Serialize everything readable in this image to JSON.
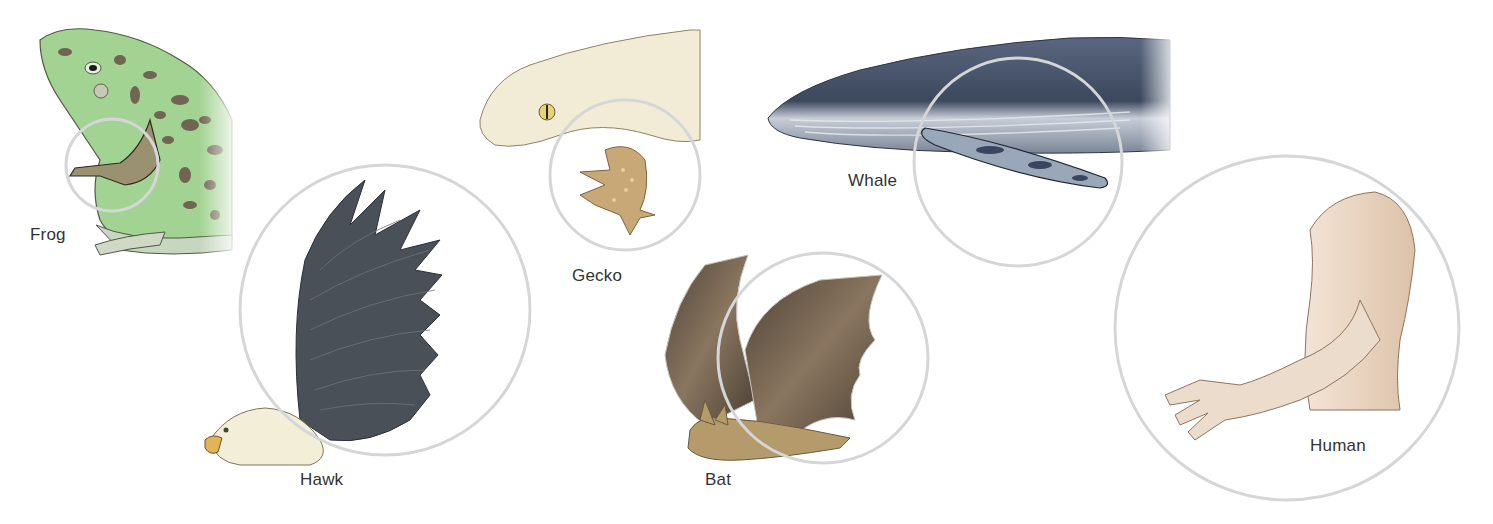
{
  "figure": {
    "colors": {
      "background": "#ffffff",
      "circle_stroke": "#d4d6d8",
      "label_text": "#333333",
      "frog_green": "#9fd08f",
      "frog_spots": "#6b5a4c",
      "hawk_wing": "#4a5058",
      "gecko_body": "#f2ecd6",
      "gecko_limb": "#c9a877",
      "whale_body": "#3f4d62",
      "bat_wing": "#5a4e3f",
      "bat_body": "#b59b6c",
      "human_skin": "#e9d6c4"
    },
    "animals": [
      {
        "id": "frog",
        "label": "Frog"
      },
      {
        "id": "hawk",
        "label": "Hawk"
      },
      {
        "id": "gecko",
        "label": "Gecko"
      },
      {
        "id": "bat",
        "label": "Bat"
      },
      {
        "id": "whale",
        "label": "Whale"
      },
      {
        "id": "human",
        "label": "Human"
      }
    ]
  }
}
